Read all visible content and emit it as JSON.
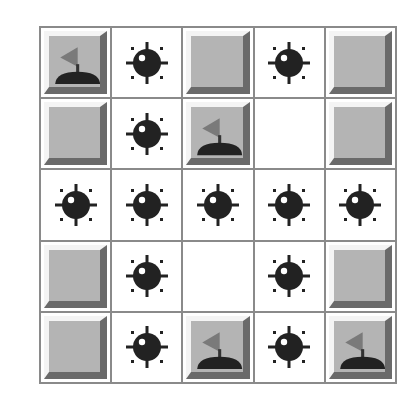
{
  "game": {
    "title": "Minesweeper board",
    "rows": 5,
    "cols": 5,
    "colors": {
      "grid_line": "#8a8a8a",
      "tile_face": "#b4b4b4",
      "tile_highlight": "#f4f4f4",
      "tile_shadow": "#6a6a6a",
      "mine": "#222222",
      "flag": "#7a7a7a",
      "flag_base": "#222222",
      "revealed_bg": "#ffffff"
    },
    "board": [
      [
        "flag",
        "mine",
        "covered",
        "mine",
        "covered"
      ],
      [
        "covered",
        "mine",
        "flag",
        "empty",
        "covered"
      ],
      [
        "mine",
        "mine",
        "mine",
        "mine",
        "mine"
      ],
      [
        "covered",
        "mine",
        "empty",
        "mine",
        "covered"
      ],
      [
        "covered",
        "mine",
        "flag",
        "mine",
        "flag"
      ]
    ]
  }
}
